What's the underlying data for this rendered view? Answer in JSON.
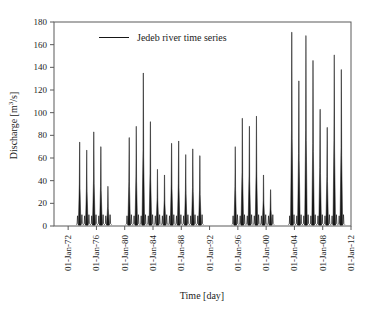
{
  "chart_data": {
    "type": "line",
    "title": "",
    "legend_label": "Jedeb river time series",
    "xlabel": "Time [day]",
    "ylabel": "Discharge [m3/s]",
    "ylabel_parts": {
      "pre": "Discharge [m",
      "sup": "3",
      "post": "/s]"
    },
    "grid": false,
    "legend_position": "top-center",
    "y_range": [
      0,
      180
    ],
    "y_ticks": [
      0,
      20,
      40,
      60,
      80,
      100,
      120,
      140,
      160,
      180
    ],
    "x_range_years": [
      1970,
      2012
    ],
    "x_tick_years": [
      1972,
      1976,
      1980,
      1984,
      1988,
      1992,
      1996,
      2000,
      2004,
      2008,
      2012
    ],
    "x_ticks": [
      "01-Jan-72",
      "01-Jan-76",
      "01-Jan-80",
      "01-Jan-84",
      "01-Jan-88",
      "01-Jan-92",
      "01-Jan-96",
      "01-Jan-00",
      "01-Jan-04",
      "01-Jan-08",
      "01-Jan-12"
    ],
    "series_name": "Jedeb river time series",
    "units": "m3/s",
    "groups": [
      {
        "name": "1973-1977",
        "peaks": [
          {
            "year": 1973,
            "peak": 74
          },
          {
            "year": 1974,
            "peak": 67
          },
          {
            "year": 1975,
            "peak": 83
          },
          {
            "year": 1976,
            "peak": 70
          },
          {
            "year": 1977,
            "peak": 35
          }
        ]
      },
      {
        "name": "1980-1990",
        "peaks": [
          {
            "year": 1980,
            "peak": 78
          },
          {
            "year": 1981,
            "peak": 88
          },
          {
            "year": 1982,
            "peak": 135
          },
          {
            "year": 1983,
            "peak": 92
          },
          {
            "year": 1984,
            "peak": 50
          },
          {
            "year": 1985,
            "peak": 45
          },
          {
            "year": 1986,
            "peak": 73
          },
          {
            "year": 1987,
            "peak": 75
          },
          {
            "year": 1988,
            "peak": 63
          },
          {
            "year": 1989,
            "peak": 68
          },
          {
            "year": 1990,
            "peak": 62
          }
        ]
      },
      {
        "name": "1995-2000",
        "peaks": [
          {
            "year": 1995,
            "peak": 70
          },
          {
            "year": 1996,
            "peak": 95
          },
          {
            "year": 1997,
            "peak": 88
          },
          {
            "year": 1998,
            "peak": 97
          },
          {
            "year": 1999,
            "peak": 45
          },
          {
            "year": 2000,
            "peak": 32
          }
        ]
      },
      {
        "name": "2003-2010",
        "peaks": [
          {
            "year": 2003,
            "peak": 171
          },
          {
            "year": 2004,
            "peak": 128
          },
          {
            "year": 2005,
            "peak": 168
          },
          {
            "year": 2006,
            "peak": 146
          },
          {
            "year": 2007,
            "peak": 103
          },
          {
            "year": 2008,
            "peak": 87
          },
          {
            "year": 2009,
            "peak": 151
          },
          {
            "year": 2010,
            "peak": 138
          }
        ]
      }
    ],
    "colors": {
      "series": "#161616",
      "axis": "#5a5a5a",
      "text": "#1c1c1c",
      "background": "#ffffff"
    }
  }
}
